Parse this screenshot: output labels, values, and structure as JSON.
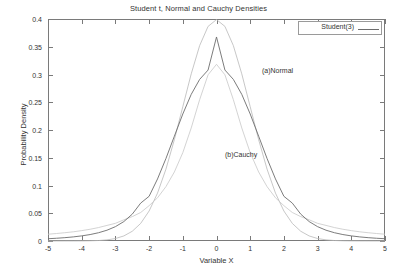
{
  "chart_data": {
    "type": "line",
    "title": "Student t, Normal and Cauchy Densities",
    "xlabel": "Variable X",
    "ylabel": "Probability Density",
    "xlim": [
      -5,
      5
    ],
    "ylim": [
      0,
      0.4
    ],
    "grid": false,
    "legend_position": "top-right",
    "legend_entries": [
      "Student(3)"
    ],
    "xticks": [
      "-5",
      "-4",
      "-3",
      "-2",
      "-1",
      "0",
      "1",
      "2",
      "3",
      "4",
      "5"
    ],
    "xtick_values": [
      -5,
      -4,
      -3,
      -2,
      -1,
      0,
      1,
      2,
      3,
      4,
      5
    ],
    "yticks": [
      "0",
      "0.05",
      "0.1",
      "0.15",
      "0.2",
      "0.25",
      "0.3",
      "0.35",
      "0.4"
    ],
    "ytick_values": [
      0,
      0.05,
      0.1,
      0.15,
      0.2,
      0.25,
      0.3,
      0.35,
      0.4
    ],
    "annotations": [
      {
        "text": "(a)Normal",
        "x": 1.35,
        "y": 0.305
      },
      {
        "text": "(b)Cauchy",
        "x": 0.25,
        "y": 0.153
      }
    ],
    "x": [
      -5,
      -4.75,
      -4.5,
      -4.25,
      -4,
      -3.75,
      -3.5,
      -3.25,
      -3,
      -2.75,
      -2.5,
      -2.25,
      -2,
      -1.75,
      -1.5,
      -1.25,
      -1,
      -0.75,
      -0.5,
      -0.25,
      0,
      0.25,
      0.5,
      0.75,
      1,
      1.25,
      1.5,
      1.75,
      2,
      2.25,
      2.5,
      2.75,
      3,
      3.25,
      3.5,
      3.75,
      4,
      4.25,
      4.5,
      4.75,
      5
    ],
    "series": [
      {
        "name": "Student(3)",
        "color": "#6d6d6d",
        "peak": 0.3676,
        "values": [
          0.00411,
          0.00494,
          0.00601,
          0.00739,
          0.00921,
          0.01163,
          0.01492,
          0.01945,
          0.02583,
          0.03497,
          0.04834,
          0.06828,
          0.08054,
          0.11181,
          0.14865,
          0.18889,
          0.22884,
          0.2642,
          0.29119,
          0.30802,
          0.3676,
          0.30802,
          0.29119,
          0.2642,
          0.22884,
          0.18889,
          0.14865,
          0.11181,
          0.08054,
          0.06828,
          0.04834,
          0.03497,
          0.02583,
          0.01945,
          0.01492,
          0.01163,
          0.00921,
          0.00739,
          0.00601,
          0.00494,
          0.00411
        ]
      },
      {
        "name": "(a)Normal",
        "color": "#b9b9b9",
        "peak": 0.3989,
        "values": [
          1.5e-06,
          5.5e-06,
          1.6e-05,
          4.47e-05,
          0.0001338,
          0.0003534,
          0.0008727,
          0.0020277,
          0.0044318,
          0.0091058,
          0.0175283,
          0.031682,
          0.053991,
          0.0862773,
          0.1295176,
          0.1826491,
          0.2419707,
          0.3011374,
          0.3520653,
          0.3866681,
          0.3989423,
          0.3866681,
          0.3520653,
          0.3011374,
          0.2419707,
          0.1826491,
          0.1295176,
          0.0862773,
          0.053991,
          0.031682,
          0.0175283,
          0.0091058,
          0.0044318,
          0.0020277,
          0.0008727,
          0.0003534,
          0.0001338,
          4.47e-05,
          1.6e-05,
          5.5e-06,
          1.5e-06
        ]
      },
      {
        "name": "(b)Cauchy",
        "color": "#c8c8c8",
        "peak": 0.3183,
        "values": [
          0.01224,
          0.01347,
          0.0149,
          0.01657,
          0.01872,
          0.02118,
          0.02422,
          0.02807,
          0.03183,
          0.03816,
          0.0439,
          0.05135,
          0.06366,
          0.07786,
          0.09794,
          0.12444,
          0.15915,
          0.20372,
          0.25465,
          0.29944,
          0.31831,
          0.29944,
          0.25465,
          0.20372,
          0.15915,
          0.12444,
          0.09794,
          0.07786,
          0.06366,
          0.05135,
          0.0439,
          0.03816,
          0.03183,
          0.02807,
          0.02422,
          0.02118,
          0.01872,
          0.01657,
          0.0149,
          0.01347,
          0.01224
        ]
      }
    ]
  },
  "figure": {
    "background": "#ffffff",
    "frame_color": "#7a7a7a",
    "text_color": "#333333"
  }
}
